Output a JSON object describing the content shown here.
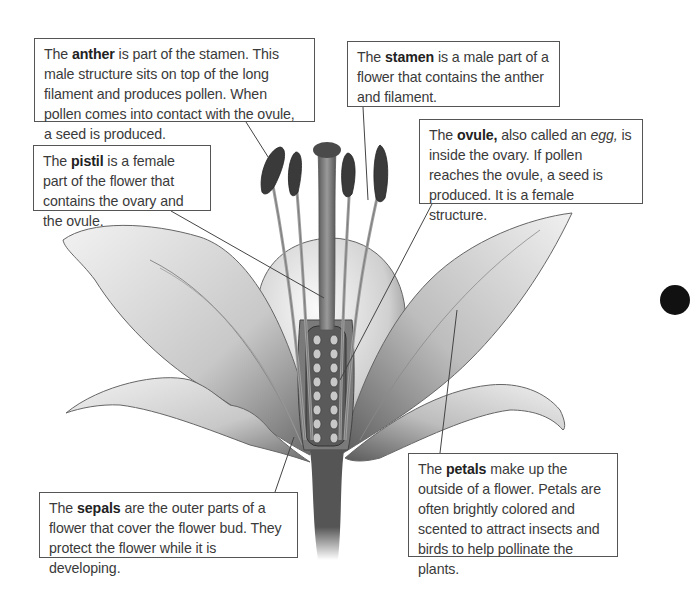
{
  "diagram": {
    "subject": "Parts of a flower",
    "callouts": {
      "anther": {
        "prefix": "The ",
        "term": "anther",
        "text": " is part of the stamen. This male structure sits on top of the long filament and produces pollen. When pollen comes into contact with the ovule, a seed is produced."
      },
      "stamen": {
        "prefix": "The ",
        "term": "stamen",
        "text": " is a male part of a flower that contains the anther and filament."
      },
      "ovule": {
        "prefix": "The ",
        "term": "ovule,",
        "text_before_italic": " also called an ",
        "italic": "egg,",
        "text": " is inside the ovary. If pollen reaches the ovule, a seed is produced. It is a female structure."
      },
      "pistil": {
        "prefix": "The ",
        "term": "pistil",
        "text": " is a female part of the flower that contains the ovary and the ovule."
      },
      "sepals": {
        "prefix": "The ",
        "term": "sepals",
        "text": " are the outer parts of a flower that cover the flower bud. They protect the flower while it is developing."
      },
      "petals": {
        "prefix": "The ",
        "term": "petals",
        "text": " make up the outside of a flower. Petals are often brightly colored and scented to attract insects and birds to help pollinate the plants."
      }
    },
    "colors": {
      "border": "#555555",
      "text": "#3a3a3a",
      "illustration": "#888888"
    }
  }
}
